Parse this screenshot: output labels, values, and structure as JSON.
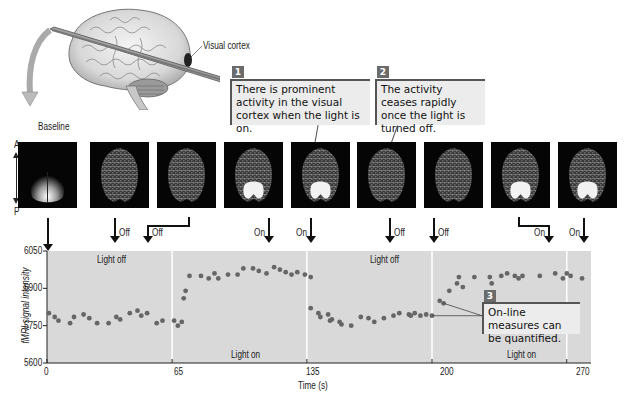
{
  "brain_figure": {
    "visual_cortex_label": "Visual cortex",
    "baseline_label": "Baseline",
    "orientation": {
      "anterior": "A",
      "posterior": "P"
    }
  },
  "callouts": [
    {
      "number": "1",
      "text": "There is prominent activity in the visual cortex when the light is on."
    },
    {
      "number": "2",
      "text": "The activity ceases rapidly once the light is turned off."
    },
    {
      "number": "3",
      "text": "On-line measures can be quantified."
    }
  ],
  "scans": [
    {
      "label": "Baseline",
      "activation": "baseline"
    },
    {
      "label": "Off",
      "activation": "none"
    },
    {
      "label": "Off",
      "activation": "none"
    },
    {
      "label": "On",
      "activation": "strong"
    },
    {
      "label": "On",
      "activation": "strong"
    },
    {
      "label": "Off",
      "activation": "none"
    },
    {
      "label": "Off",
      "activation": "none"
    },
    {
      "label": "On",
      "activation": "strong"
    },
    {
      "label": "On",
      "activation": "strong"
    }
  ],
  "chart_data": {
    "type": "scatter",
    "title": "",
    "xlabel": "Time (s)",
    "ylabel": "fMRI signal intensity",
    "xlim": [
      0,
      280
    ],
    "ylim": [
      5600,
      6050
    ],
    "x_ticks": [
      0,
      65,
      135,
      200,
      270
    ],
    "y_ticks": [
      5600,
      5750,
      5900,
      6050
    ],
    "grid": false,
    "region_labels": [
      {
        "text": "Light off",
        "x_range": [
          0,
          65
        ]
      },
      {
        "text": "Light on",
        "x_range": [
          65,
          135
        ]
      },
      {
        "text": "Light off",
        "x_range": [
          135,
          200
        ]
      },
      {
        "text": "Light on",
        "x_range": [
          200,
          280
        ]
      }
    ],
    "boundaries": [
      65,
      135,
      200,
      270
    ],
    "series": [
      {
        "name": "fMRI signal",
        "color": "#666666",
        "points": [
          [
            1,
            5800
          ],
          [
            4,
            5785
          ],
          [
            6,
            5770
          ],
          [
            12,
            5760
          ],
          [
            14,
            5785
          ],
          [
            19,
            5795
          ],
          [
            22,
            5780
          ],
          [
            26,
            5760
          ],
          [
            32,
            5760
          ],
          [
            36,
            5785
          ],
          [
            38,
            5775
          ],
          [
            43,
            5800
          ],
          [
            47,
            5810
          ],
          [
            49,
            5790
          ],
          [
            52,
            5800
          ],
          [
            57,
            5760
          ],
          [
            60,
            5770
          ],
          [
            66,
            5770
          ],
          [
            68,
            5750
          ],
          [
            70,
            5765
          ],
          [
            71,
            5860
          ],
          [
            72,
            5890
          ],
          [
            74,
            5950
          ],
          [
            80,
            5950
          ],
          [
            84,
            5940
          ],
          [
            87,
            5960
          ],
          [
            89,
            5940
          ],
          [
            94,
            5955
          ],
          [
            99,
            5955
          ],
          [
            102,
            5980
          ],
          [
            107,
            5980
          ],
          [
            110,
            5970
          ],
          [
            114,
            5960
          ],
          [
            118,
            5985
          ],
          [
            121,
            5975
          ],
          [
            124,
            5965
          ],
          [
            127,
            5955
          ],
          [
            130,
            5965
          ],
          [
            134,
            5955
          ],
          [
            137,
            5945
          ],
          [
            137,
            5820
          ],
          [
            141,
            5800
          ],
          [
            142,
            5785
          ],
          [
            146,
            5795
          ],
          [
            147,
            5770
          ],
          [
            148,
            5775
          ],
          [
            152,
            5765
          ],
          [
            153,
            5755
          ],
          [
            158,
            5750
          ],
          [
            163,
            5785
          ],
          [
            167,
            5780
          ],
          [
            170,
            5765
          ],
          [
            175,
            5780
          ],
          [
            180,
            5790
          ],
          [
            183,
            5800
          ],
          [
            188,
            5795
          ],
          [
            189,
            5790
          ],
          [
            191,
            5800
          ],
          [
            194,
            5790
          ],
          [
            197,
            5795
          ],
          [
            200,
            5790
          ],
          [
            204,
            5850
          ],
          [
            206,
            5840
          ],
          [
            209,
            5890
          ],
          [
            213,
            5920
          ],
          [
            214,
            5945
          ],
          [
            216,
            5905
          ],
          [
            222,
            5945
          ],
          [
            230,
            5945
          ],
          [
            231,
            5920
          ],
          [
            236,
            5950
          ],
          [
            239,
            5960
          ],
          [
            243,
            5950
          ],
          [
            245,
            5940
          ],
          [
            247,
            5950
          ],
          [
            256,
            5950
          ],
          [
            264,
            5960
          ],
          [
            268,
            5940
          ],
          [
            270,
            5960
          ],
          [
            272,
            5950
          ],
          [
            278,
            5940
          ]
        ]
      }
    ],
    "annotations": [
      {
        "text": "On-line measures can be quantified.",
        "number": "3"
      }
    ]
  },
  "axis": {
    "y_ticks": [
      "6050",
      "5900",
      "5750",
      "5600"
    ],
    "x_ticks": [
      "0",
      "65",
      "135",
      "200",
      "270"
    ],
    "xlabel": "Time (s)",
    "ylabel": "fMRI signal intensity",
    "regions": [
      "Light off",
      "Light on",
      "Light off",
      "Light on"
    ]
  }
}
